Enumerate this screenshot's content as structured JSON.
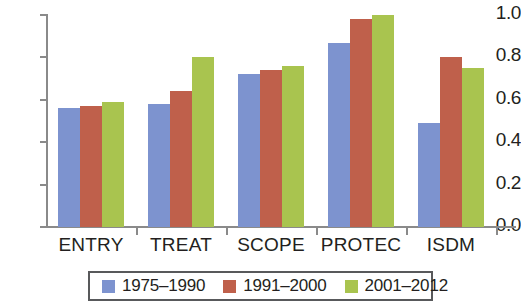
{
  "chart_data": {
    "type": "bar",
    "title": "",
    "subtitle": "",
    "xlabel": "",
    "ylabel": "",
    "ylim": [
      0.0,
      1.0
    ],
    "yticks": [
      "0.0",
      "0.2",
      "0.4",
      "0.6",
      "0.8",
      "1.0"
    ],
    "ytick_values": [
      0.0,
      0.2,
      0.4,
      0.6,
      0.8,
      1.0
    ],
    "grid": false,
    "legend_position": "bottom",
    "categories": [
      "ENTRY",
      "TREAT",
      "SCOPE",
      "PROTEC",
      "ISDM"
    ],
    "series": [
      {
        "name": "1975–1990",
        "color": "#7d93cf",
        "values": [
          0.56,
          0.58,
          0.72,
          0.87,
          0.49
        ]
      },
      {
        "name": "1991–2000",
        "color": "#bf604b",
        "values": [
          0.57,
          0.64,
          0.74,
          0.98,
          0.8
        ]
      },
      {
        "name": "2001–2012",
        "color": "#a9c44f",
        "values": [
          0.59,
          0.8,
          0.76,
          1.0,
          0.75
        ]
      }
    ]
  },
  "colors": {
    "series_1975_1990": "#7d93cf",
    "series_1991_2000": "#bf604b",
    "series_2001_2012": "#a9c44f",
    "axis": "#8a8a8a",
    "text": "#231f20",
    "legend_border": "#58595b",
    "background": "#ffffff"
  }
}
